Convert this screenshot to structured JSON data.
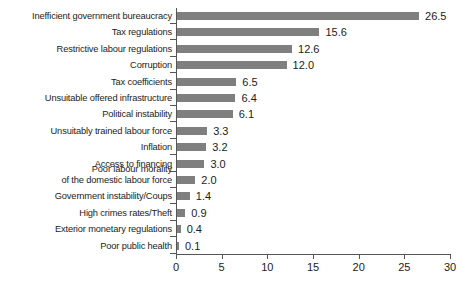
{
  "chart_data": {
    "type": "bar",
    "orientation": "horizontal",
    "title": "",
    "subtitle": "",
    "xlabel": "",
    "ylabel": "",
    "xlim": [
      0,
      30
    ],
    "xticks": [
      "0",
      "5",
      "10",
      "15",
      "20",
      "25",
      "30"
    ],
    "xtick_values": [
      0,
      5,
      10,
      15,
      20,
      25,
      30
    ],
    "grid": false,
    "legend": null,
    "bar_color": "#7f7f7f",
    "axis_color": "#555555",
    "background_color": "#ffffff",
    "data_labels_shown": true,
    "categories": [
      "Inefficient government bureaucracy",
      "Tax regulations",
      "Restrictive labour regulations",
      "Corruption",
      "Tax coefficients",
      "Unsuitable offered infrastructure",
      "Political instability",
      "Unsuitably trained labour force",
      "Inflation",
      "Access to financing",
      "Poor labour morality of the domestic labour force",
      "Government instability/Coups",
      "High crimes rates/Theft",
      "Exterior monetary regulations",
      "Poor public health"
    ],
    "category_lines": [
      [
        "Inefficient government bureaucracy"
      ],
      [
        "Tax regulations"
      ],
      [
        "Restrictive labour regulations"
      ],
      [
        "Corruption"
      ],
      [
        "Tax coefficients"
      ],
      [
        "Unsuitable offered infrastructure"
      ],
      [
        "Political instability"
      ],
      [
        "Unsuitably trained labour force"
      ],
      [
        "Inflation"
      ],
      [
        "Access to financing"
      ],
      [
        "Poor labour morality",
        "of the domestic labour force"
      ],
      [
        "Government instability/Coups"
      ],
      [
        "High crimes rates/Theft"
      ],
      [
        "Exterior monetary regulations"
      ],
      [
        "Poor public health"
      ]
    ],
    "values": [
      26.5,
      15.6,
      12.6,
      12.0,
      6.5,
      6.4,
      6.1,
      3.3,
      3.2,
      3.0,
      2.0,
      1.4,
      0.9,
      0.4,
      0.1
    ],
    "value_labels": [
      "26.5",
      "15.6",
      "12.6",
      "12.0",
      "6.5",
      "6.4",
      "6.1",
      "3.3",
      "3.2",
      "3.0",
      "2.0",
      "1.4",
      "0.9",
      "0.4",
      "0.1"
    ]
  }
}
